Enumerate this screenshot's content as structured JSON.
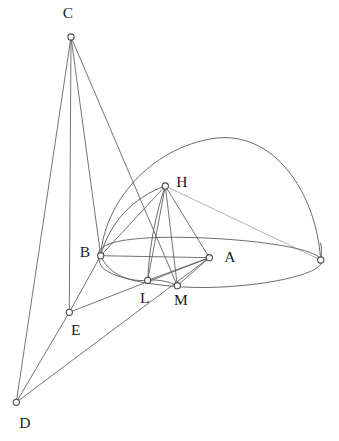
{
  "figure": {
    "kind": "geometry-diagram",
    "canvas": {
      "width": 339,
      "height": 441
    },
    "stroke_color": "#5a5a5a",
    "label_color": "#1b1b1b",
    "background_color": "#ffffff",
    "vertices": [
      {
        "id": "C",
        "label": "C",
        "x": 71,
        "y": 37,
        "label_x": 68,
        "label_y": 14,
        "labelled": true
      },
      {
        "id": "H",
        "label": "H",
        "x": 165.3,
        "y": 186,
        "label_x": 182,
        "label_y": 183,
        "labelled": true
      },
      {
        "id": "B",
        "label": "B",
        "x": 100.7,
        "y": 255.7,
        "label_x": 85,
        "label_y": 253,
        "labelled": true
      },
      {
        "id": "A",
        "label": "A",
        "x": 209.3,
        "y": 257.7,
        "label_x": 230,
        "label_y": 258,
        "labelled": true
      },
      {
        "id": "L",
        "label": "L",
        "x": 147.7,
        "y": 280.3,
        "label_x": 145,
        "label_y": 299,
        "labelled": true
      },
      {
        "id": "M",
        "label": "M",
        "x": 177.3,
        "y": 285.7,
        "label_x": 181,
        "label_y": 301,
        "labelled": true
      },
      {
        "id": "E",
        "label": "E",
        "x": 69.3,
        "y": 312.3,
        "label_x": 76,
        "label_y": 331,
        "labelled": true
      },
      {
        "id": "D",
        "label": "D",
        "x": 16.3,
        "y": 402.3,
        "label_x": 25,
        "label_y": 424,
        "labelled": true
      },
      {
        "id": "R",
        "label": "",
        "x": 320.7,
        "y": 260,
        "label_x": 0,
        "label_y": 0,
        "labelled": false
      }
    ],
    "segments": [
      {
        "id": "C-D",
        "from": "C",
        "to": "D"
      },
      {
        "id": "C-E",
        "from": "C",
        "to": "E"
      },
      {
        "id": "C-B",
        "from": "C",
        "to": "B"
      },
      {
        "id": "C-M",
        "from": "C",
        "to": "M"
      },
      {
        "id": "D-E",
        "from": "D",
        "to": "E"
      },
      {
        "id": "D-A",
        "from": "D",
        "to": "A"
      },
      {
        "id": "E-A",
        "from": "E",
        "to": "A"
      },
      {
        "id": "B-E",
        "from": "B",
        "to": "E"
      },
      {
        "id": "B-A",
        "from": "B",
        "to": "A"
      },
      {
        "id": "B-H",
        "from": "B",
        "to": "H"
      },
      {
        "id": "H-A",
        "from": "H",
        "to": "A"
      },
      {
        "id": "H-L",
        "from": "H",
        "to": "L"
      },
      {
        "id": "H-M",
        "from": "H",
        "to": "M"
      },
      {
        "id": "L-A",
        "from": "L",
        "to": "A"
      },
      {
        "id": "M-A",
        "from": "M",
        "to": "A"
      },
      {
        "id": "R-H",
        "from": "R",
        "to": "H",
        "hidden": true
      }
    ],
    "curves": [
      {
        "id": "base-ellipse",
        "role": "base-circle-in-perspective",
        "path": "M 98.5 253.5 C 98.0 240.5 140.0 235.5 200.0 237.8 C 262.0 240.2 318.0 249.0 321.5 260.5 C 324.5 270.5 286.0 283.0 226.0 286.8 C 166.0 290.5 113.0 279.0 102.5 267.5 C 99.0 263.5 98.6 257.5 98.5 253.5 Z"
      },
      {
        "id": "outer-dome-arc",
        "role": "hemisphere-great-arc",
        "path": "M 100.7 255.7 C 104.0 203.0 150.0 148.5 213.0 138.5 C 272.0 129.5 316.0 190.0 320.7 260.0"
      },
      {
        "id": "inner-arc-b-h",
        "role": "small-arc-through-h",
        "path": "M 100.7 255.7 C 109.0 223.0 134.0 196.5 165.3 186.0"
      },
      {
        "id": "lower-arc-b-l",
        "role": "lower-arc-through-l-m",
        "path": "M 100.7 255.7 C 107.5 272.0 126.0 282.5 147.7 280.3 C 160.0 279.0 171.0 282.5 177.3 285.7"
      },
      {
        "id": "arc-h-l",
        "role": "vertical-arc-h-to-l",
        "path": "M 165.3 186.0 C 156.0 212.0 149.0 248.0 147.7 280.3"
      },
      {
        "id": "arc-right-dome-tail",
        "role": "dome-right-foot",
        "path": "M 320.7 260.0 C 321.8 255.0 321.8 248.0 320.6 243.0"
      }
    ]
  }
}
